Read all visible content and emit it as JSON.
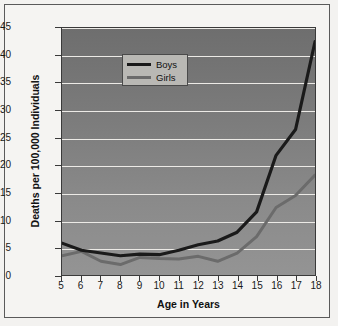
{
  "chart_data": {
    "type": "line",
    "title": "",
    "xlabel": "Age in Years",
    "ylabel": "Deaths per 100,000 Individuals",
    "x": [
      5,
      6,
      7,
      8,
      9,
      10,
      11,
      12,
      13,
      14,
      15,
      16,
      17,
      18
    ],
    "xticklabels": [
      "5",
      "6",
      "7",
      "8",
      "9",
      "10",
      "11",
      "12",
      "13",
      "14",
      "15",
      "16",
      "17",
      "18"
    ],
    "yticklabels": [
      "0",
      "5",
      "10",
      "15",
      "20",
      "25",
      "30",
      "35",
      "40",
      "45"
    ],
    "yticks": [
      0,
      5,
      10,
      15,
      20,
      25,
      30,
      35,
      40,
      45
    ],
    "xlim": [
      5,
      18
    ],
    "ylim": [
      0,
      45
    ],
    "grid": "horizontal",
    "legend_position": "top-left",
    "series": [
      {
        "name": "Boys",
        "color": "#1a1a1a",
        "values": [
          5.8,
          4.5,
          4.0,
          3.5,
          3.8,
          3.7,
          4.5,
          5.5,
          6.2,
          7.8,
          11.5,
          21.8,
          26.5,
          42.5
        ]
      },
      {
        "name": "Girls",
        "color": "#6b6b6b",
        "values": [
          3.5,
          4.3,
          2.5,
          1.9,
          3.2,
          3.0,
          2.9,
          3.4,
          2.5,
          4.0,
          7.0,
          12.3,
          14.5,
          18.2
        ]
      }
    ]
  },
  "colors": {
    "plot_background_top": "#6e6e6e",
    "plot_background_bottom": "#949494",
    "gridline": "#eceae6",
    "page_background": "#f5f4f2",
    "border": "#5a5a5a",
    "legend_background": "#b9b8b4",
    "boys_line": "#1a1a1a",
    "girls_line": "#6b6b6b"
  }
}
